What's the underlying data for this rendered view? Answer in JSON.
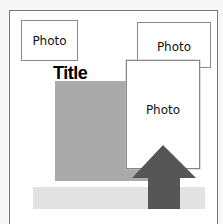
{
  "layout": {
    "title": "Title",
    "photos": [
      {
        "label": "Photo"
      },
      {
        "label": "Photo"
      },
      {
        "label": "Photo"
      }
    ],
    "colors": {
      "frame_border": "#777777",
      "gray_block": "#aaaaaa",
      "strip": "#e2e2e2",
      "arrow": "#555555"
    }
  }
}
